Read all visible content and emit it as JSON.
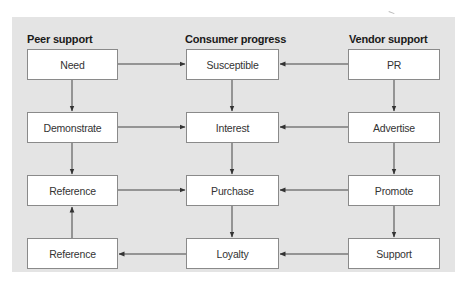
{
  "diagram": {
    "columns": [
      {
        "id": "peer",
        "header": "Peer support"
      },
      {
        "id": "consumer",
        "header": "Consumer progress"
      },
      {
        "id": "vendor",
        "header": "Vendor support"
      }
    ],
    "nodes": {
      "need": "Need",
      "demonstrate": "Demonstrate",
      "reference_1": "Reference",
      "reference_2": "Reference",
      "susceptible": "Susceptible",
      "interest": "Interest",
      "purchase": "Purchase",
      "loyalty": "Loyalty",
      "pr": "PR",
      "advertise": "Advertise",
      "promote": "Promote",
      "support": "Support"
    },
    "edges": [
      {
        "from": "need",
        "to": "susceptible"
      },
      {
        "from": "need",
        "to": "demonstrate"
      },
      {
        "from": "demonstrate",
        "to": "interest"
      },
      {
        "from": "demonstrate",
        "to": "reference_1"
      },
      {
        "from": "reference_1",
        "to": "purchase"
      },
      {
        "from": "reference_2",
        "to": "reference_1"
      },
      {
        "from": "susceptible",
        "to": "interest"
      },
      {
        "from": "interest",
        "to": "purchase"
      },
      {
        "from": "purchase",
        "to": "loyalty"
      },
      {
        "from": "loyalty",
        "to": "reference_2"
      },
      {
        "from": "pr",
        "to": "susceptible"
      },
      {
        "from": "pr",
        "to": "advertise"
      },
      {
        "from": "advertise",
        "to": "interest"
      },
      {
        "from": "advertise",
        "to": "promote"
      },
      {
        "from": "promote",
        "to": "purchase"
      },
      {
        "from": "promote",
        "to": "support"
      },
      {
        "from": "support",
        "to": "loyalty"
      }
    ],
    "colors": {
      "panel_background": "#e4e4e4",
      "box_fill": "#ffffff",
      "box_border": "#8a8a8a",
      "arrow": "#333333"
    }
  }
}
